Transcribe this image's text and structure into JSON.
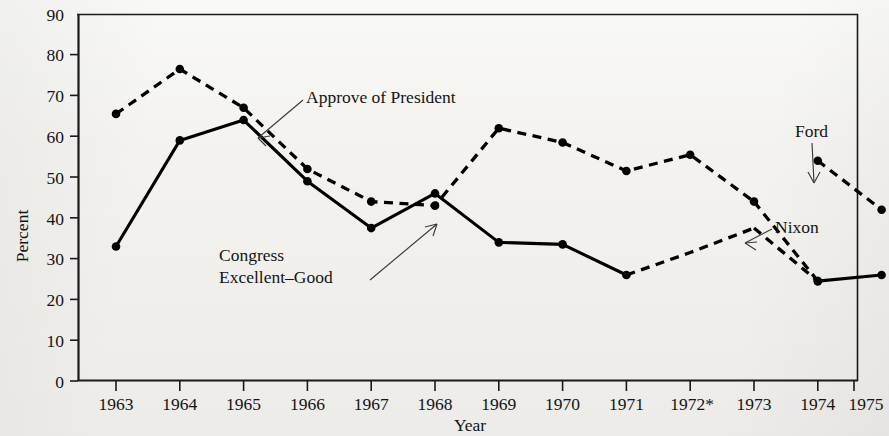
{
  "chart_data": {
    "type": "line",
    "title": "",
    "xlabel": "Year",
    "ylabel": "Percent",
    "xlim": [
      1963,
      1975
    ],
    "ylim": [
      0,
      90
    ],
    "ytick_step": 10,
    "grid": false,
    "legend": "inline-annotations",
    "categories": [
      "1963",
      "1964",
      "1965",
      "1966",
      "1967",
      "1968",
      "1969",
      "1970",
      "1971",
      "1972*",
      "1973",
      "1974",
      "1975"
    ],
    "x": [
      1963,
      1964,
      1965,
      1966,
      1967,
      1968,
      1969,
      1970,
      1971,
      1972,
      1973,
      1974,
      1975
    ],
    "series": [
      {
        "name": "Congress Excellent-Good",
        "style": "solid",
        "values": [
          33,
          59,
          64,
          49,
          37.5,
          46,
          34,
          33.5,
          26,
          null,
          null,
          24.5,
          26
        ],
        "segments": [
          {
            "style": "solid",
            "x": [
              1963,
              1964,
              1965,
              1966,
              1967,
              1968,
              1969,
              1970,
              1971
            ],
            "y": [
              33,
              59,
              64,
              49,
              37.5,
              46,
              34,
              33.5,
              26
            ]
          },
          {
            "style": "dashed",
            "x": [
              1971,
              1972,
              1973
            ],
            "y": [
              26,
              31.5,
              37.5
            ]
          },
          {
            "style": "dashed",
            "x": [
              1973,
              1974
            ],
            "y": [
              37.5,
              24.5
            ]
          },
          {
            "style": "solid",
            "x": [
              1974,
              1975
            ],
            "y": [
              24.5,
              26
            ]
          }
        ]
      },
      {
        "name": "Approve of President",
        "style": "dashed",
        "values": [
          65.5,
          76.5,
          67,
          52,
          44,
          43,
          62,
          58.5,
          51.5,
          55.5,
          44,
          null,
          null
        ],
        "segments": [
          {
            "style": "dashed",
            "x": [
              1963,
              1964,
              1965,
              1966,
              1967,
              1968,
              1969,
              1970,
              1971,
              1972,
              1973
            ],
            "y": [
              65.5,
              76.5,
              67,
              52,
              44,
              43,
              62,
              58.5,
              51.5,
              55.5,
              44
            ]
          },
          {
            "style": "dashed",
            "x": [
              1973,
              1974
            ],
            "y": [
              44,
              24.5
            ]
          }
        ]
      },
      {
        "name": "Ford",
        "style": "dashed",
        "values_by_year": {
          "1974": 54,
          "1975": 42
        },
        "segments": [
          {
            "style": "dashed",
            "x": [
              1974,
              1975
            ],
            "y": [
              54,
              42
            ]
          }
        ]
      }
    ],
    "yticks": [
      0,
      10,
      20,
      30,
      40,
      50,
      60,
      70,
      80,
      90
    ],
    "ytick_labels": [
      "0",
      "10",
      "20",
      "30",
      "40",
      "50",
      "60",
      "70",
      "80",
      "90"
    ],
    "annotations": [
      {
        "name": "approve-of-president",
        "text": "Approve of President"
      },
      {
        "name": "congress-excellent-good",
        "text": "Congress\nExcellent–Good"
      },
      {
        "name": "ford",
        "text": "Ford"
      },
      {
        "name": "nixon",
        "text": "Nixon"
      }
    ]
  },
  "axes": {
    "y_title": "Percent",
    "x_title": "Year",
    "y_labels": [
      "90",
      "80",
      "70",
      "60",
      "50",
      "40",
      "30",
      "20",
      "10",
      "0"
    ],
    "x_labels": [
      "1963",
      "1964",
      "1965",
      "1966",
      "1967",
      "1968",
      "1969",
      "1970",
      "1971",
      "1972*",
      "1973",
      "1974",
      "1975"
    ]
  },
  "annotations": {
    "approve": "Approve of President",
    "congress_line1": "Congress",
    "congress_line2": "Excellent–Good",
    "ford": "Ford",
    "nixon": "Nixon"
  },
  "colors": {
    "ink": "#111111",
    "paper": "#f3f2ee",
    "line": "#000000"
  }
}
